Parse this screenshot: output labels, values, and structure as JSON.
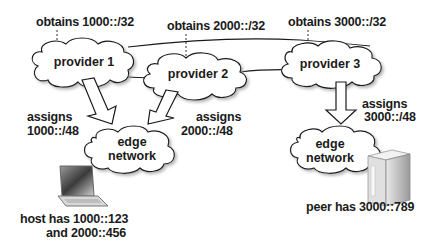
{
  "diagram": {
    "providers": [
      {
        "name": "provider 1",
        "obtains": "obtains 1000::/32",
        "assigns_label": "assigns",
        "assigns_prefix": "1000::/48"
      },
      {
        "name": "provider 2",
        "obtains": "obtains 2000::/32",
        "assigns_label": "assigns",
        "assigns_prefix": "2000::/48"
      },
      {
        "name": "provider 3",
        "obtains": "obtains 3000::/32",
        "assigns_label": "assigns",
        "assigns_prefix": "3000::/48"
      }
    ],
    "edge_networks": [
      {
        "line1": "edge",
        "line2": "network",
        "device_icon": "laptop-icon",
        "device_line1": "host has 1000::123",
        "device_line2": "and 2000::456"
      },
      {
        "line1": "edge",
        "line2": "network",
        "device_icon": "server-icon",
        "device_line1": "peer has 3000::789"
      }
    ],
    "colors": {
      "stroke": "#1a1a1a",
      "fill": "#ffffff",
      "shadow": "#b5b5b5"
    }
  }
}
